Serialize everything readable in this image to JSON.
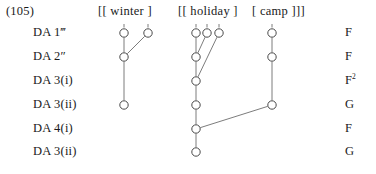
{
  "example": {
    "number": "(105)"
  },
  "header": {
    "brackets": [
      {
        "id": "winter",
        "text": "[[ winter ]"
      },
      {
        "id": "holiday",
        "text": "[[ holiday ]"
      },
      {
        "id": "camp",
        "text": "[ camp ]]]"
      }
    ]
  },
  "rows": [
    {
      "label": "DA 1‴",
      "rank": "F",
      "rank_sup": ""
    },
    {
      "label": "DA 2″",
      "rank": "F",
      "rank_sup": ""
    },
    {
      "label": "DA 3(i)",
      "rank": "F",
      "rank_sup": "2"
    },
    {
      "label": "DA 3(ii)",
      "rank": "G",
      "rank_sup": ""
    },
    {
      "label": "DA 4(i)",
      "rank": "F",
      "rank_sup": ""
    },
    {
      "label": "DA 3(ii)",
      "rank": "G",
      "rank_sup": ""
    }
  ],
  "rank_column": [
    "S",
    "F",
    "F",
    "G",
    "F",
    "G"
  ],
  "row_labels": [
    "DA 1‴",
    "DA 2″",
    "DA 3(i)",
    "DA 3(ii)",
    "DA 4(i)",
    "DA 3(ii)"
  ],
  "chart_data": {
    "type": "diagram",
    "title": "(105)",
    "columns": [
      {
        "id": "winter-a",
        "x": 124,
        "group": "winter"
      },
      {
        "id": "winter-b",
        "x": 148,
        "group": "winter"
      },
      {
        "id": "holiday-a",
        "x": 196,
        "group": "holiday"
      },
      {
        "id": "holiday-b",
        "x": 207,
        "group": "holiday"
      },
      {
        "id": "holiday-c",
        "x": 219,
        "group": "holiday"
      },
      {
        "id": "camp-a",
        "x": 272,
        "group": "camp"
      }
    ],
    "row_y": [
      33,
      57,
      81,
      105,
      129,
      152
    ],
    "nodes": [
      {
        "id": "n1",
        "x": 124,
        "y": 33,
        "r": 4.2
      },
      {
        "id": "n2",
        "x": 148,
        "y": 33,
        "r": 4.2
      },
      {
        "id": "n3",
        "x": 124,
        "y": 57,
        "r": 4.2
      },
      {
        "id": "n4",
        "x": 124,
        "y": 105,
        "r": 4.2
      },
      {
        "id": "n5",
        "x": 196,
        "y": 33,
        "r": 4.2
      },
      {
        "id": "n6",
        "x": 207,
        "y": 33,
        "r": 4.2
      },
      {
        "id": "n7",
        "x": 219,
        "y": 33,
        "r": 4.2
      },
      {
        "id": "n8",
        "x": 196,
        "y": 57,
        "r": 4.2
      },
      {
        "id": "n9",
        "x": 196,
        "y": 81,
        "r": 4.2
      },
      {
        "id": "n10",
        "x": 196,
        "y": 105,
        "r": 4.2
      },
      {
        "id": "n11",
        "x": 196,
        "y": 129,
        "r": 4.2
      },
      {
        "id": "n12",
        "x": 196,
        "y": 152,
        "r": 4.2
      },
      {
        "id": "n13",
        "x": 272,
        "y": 33,
        "r": 4.2
      },
      {
        "id": "n14",
        "x": 272,
        "y": 57,
        "r": 4.2
      },
      {
        "id": "n15",
        "x": 272,
        "y": 105,
        "r": 4.2
      }
    ],
    "edges": [
      {
        "from": "n1",
        "to": "n3",
        "kind": "vertical"
      },
      {
        "from": "n2",
        "to": "n3",
        "kind": "diagonal"
      },
      {
        "from": "n3",
        "to": "n4",
        "kind": "vertical"
      },
      {
        "from": "n5",
        "to": "n8",
        "kind": "vertical"
      },
      {
        "from": "n6",
        "to": "n8",
        "kind": "diagonal"
      },
      {
        "from": "n7",
        "to": "n9",
        "kind": "diagonal"
      },
      {
        "from": "n8",
        "to": "n9",
        "kind": "vertical"
      },
      {
        "from": "n9",
        "to": "n10",
        "kind": "vertical"
      },
      {
        "from": "n10",
        "to": "n11",
        "kind": "vertical"
      },
      {
        "from": "n11",
        "to": "n12",
        "kind": "vertical"
      },
      {
        "from": "n13",
        "to": "n14",
        "kind": "vertical"
      },
      {
        "from": "n14",
        "to": "n15",
        "kind": "vertical"
      },
      {
        "from": "n15",
        "to": "n11",
        "kind": "diagonal"
      }
    ],
    "ticks": [
      {
        "x": 124,
        "y": 24
      },
      {
        "x": 148,
        "y": 24
      },
      {
        "x": 196,
        "y": 24
      },
      {
        "x": 207,
        "y": 24
      },
      {
        "x": 219,
        "y": 24
      },
      {
        "x": 272,
        "y": 24
      }
    ],
    "colors": {
      "background": "#ffffff",
      "text": "#1a1a1a",
      "line": "#6d6d6d",
      "node_stroke": "#4a4a4a",
      "node_fill": "#ffffff"
    }
  }
}
